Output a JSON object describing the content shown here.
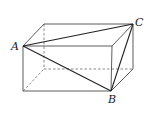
{
  "diagram": {
    "type": "rectangular-box",
    "labels": {
      "A": "A",
      "B": "B",
      "C": "C"
    },
    "vertices": {
      "A": [
        23,
        46
      ],
      "front_top_right": [
        112,
        46
      ],
      "B": [
        111,
        91
      ],
      "front_bottom_left": [
        23,
        91
      ],
      "back_top_left": [
        44,
        24
      ],
      "C": [
        133,
        24
      ],
      "back_bottom_right": [
        133,
        69
      ],
      "back_bottom_left": [
        44,
        69
      ]
    },
    "colors": {
      "edge": "#333333",
      "hidden_edge": "#555555",
      "diagonal": "#222222"
    }
  }
}
